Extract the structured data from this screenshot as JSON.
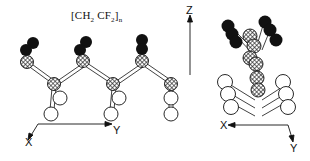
{
  "diagram": {
    "formula": {
      "open": "[CH",
      "sub1": "2",
      "mid": " CF",
      "sub2": "2",
      "close": "]",
      "subscript_n": "n"
    },
    "left_view": {
      "axes": {
        "vertical": "Z",
        "horizontal": "Y",
        "depth": "X"
      },
      "atom_types": {
        "fluorine": {
          "style": "filled-black",
          "color": "#111111"
        },
        "carbon": {
          "style": "cross-hatched",
          "color": "#555555"
        },
        "hydrogen": {
          "style": "open-white",
          "color": "#ffffff"
        }
      },
      "repeat_units": 3
    },
    "right_view": {
      "axes": {
        "horizontal": "X",
        "depth": "Y"
      },
      "description": "End-on projection along chain axis"
    }
  }
}
